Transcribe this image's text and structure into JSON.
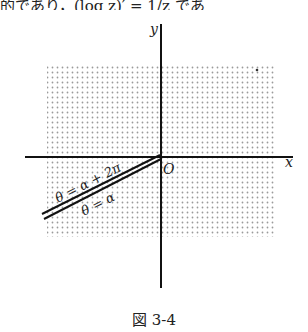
{
  "top_text": "的であり，(log z)′ = 1/z であ",
  "figure": {
    "axis_labels": {
      "x": "x",
      "y": "y",
      "origin": "O"
    },
    "ray_labels": {
      "upper": "θ = α + 2π",
      "lower": "θ = α"
    },
    "caption": "図 3-4",
    "colors": {
      "axis": "#111111",
      "shade_dot": "#9a9a9a",
      "text": "#222222"
    }
  }
}
